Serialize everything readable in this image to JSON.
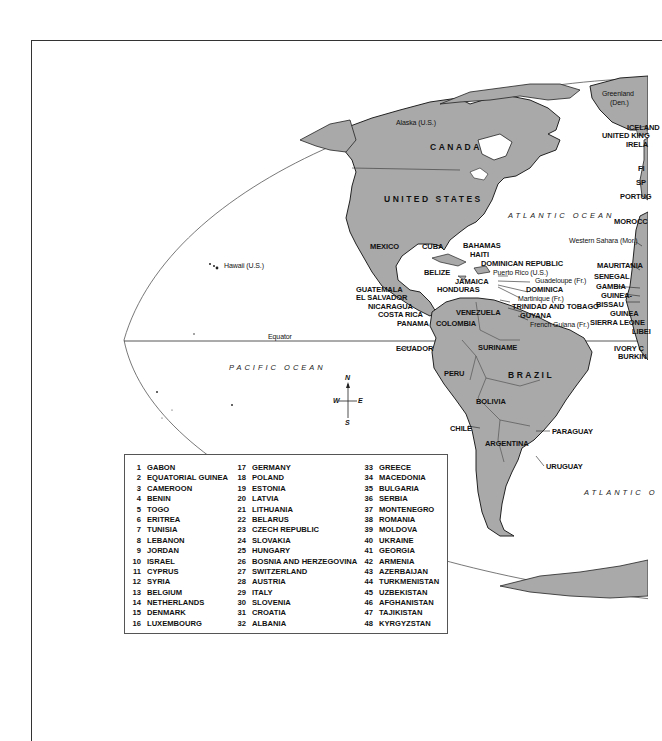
{
  "map": {
    "oceans": {
      "atlantic_north": "ATLANTIC OCEAN",
      "atlantic_south": "ATLANTIC O",
      "pacific": "PACIFIC OCEAN"
    },
    "lines": {
      "equator": "Equator"
    },
    "compass": {
      "n": "N",
      "s": "S",
      "e": "E",
      "w": "W"
    },
    "regions": {
      "greenland": "Greenland",
      "greenland_owner": "(Den.)",
      "alaska": "Alaska (U.S.)",
      "hawaii": "Hawaii (U.S.)",
      "western_sahara": "Western Sahara (Mor.)",
      "puerto_rico": "Puerto Rico (U.S.)",
      "guadeloupe": "Guadeloupe (Fr.)",
      "martinique": "Martinique (Fr.)",
      "french_guiana": "French Guiana (Fr.)"
    },
    "countries": {
      "canada": "CANADA",
      "united_states": "UNITED STATES",
      "brazil": "BRAZIL",
      "iceland": "ICELAND",
      "united_kingdom": "UNITED KING",
      "ireland": "IRELA",
      "france": "FI",
      "spain": "SP",
      "portugal": "PORTUG",
      "morocco": "MOROCC",
      "mexico": "MEXICO",
      "cuba": "CUBA",
      "bahamas": "BAHAMAS",
      "haiti": "HAITI",
      "dominican_republic": "DOMINICAN REPUBLIC",
      "belize": "BELIZE",
      "jamaica": "JAMAICA",
      "dominica": "DOMINICA",
      "honduras": "HONDURAS",
      "guatemala": "GUATEMALA",
      "el_salvador": "EL SALVADOR",
      "nicaragua": "NICARAGUA",
      "costa_rica": "COSTA RICA",
      "panama": "PANAMA",
      "colombia": "COLOMBIA",
      "venezuela": "VENEZUELA",
      "trinidad": "TRINIDAD AND TOBAGO",
      "guyana": "GUYANA",
      "suriname": "SURINAME",
      "ecuador": "ECUADOR",
      "peru": "PERU",
      "bolivia": "BOLIVIA",
      "chile": "CHILE",
      "argentina": "ARGENTINA",
      "paraguay": "PARAGUAY",
      "uruguay": "URUGUAY",
      "mauritania": "MAURITANIA",
      "senegal": "SENEGAL",
      "gambia": "GAMBIA",
      "guinea_bissau_1": "GUINEA-",
      "guinea_bissau_2": "BISSAU",
      "guinea": "GUINEA",
      "sierra_leone": "SIERRA LEONE",
      "liberia": "LIBEI",
      "ivory_coast": "IVORY C",
      "burkina": "BURKIN"
    },
    "colors": {
      "land": "#a9a9a9",
      "land_edge": "#222222",
      "frame": "#333333"
    }
  },
  "legend": {
    "columns": [
      [
        {
          "n": "1",
          "name": "GABON"
        },
        {
          "n": "2",
          "name": "EQUATORIAL GUINEA"
        },
        {
          "n": "3",
          "name": "CAMEROON"
        },
        {
          "n": "4",
          "name": "BENIN"
        },
        {
          "n": "5",
          "name": "TOGO"
        },
        {
          "n": "6",
          "name": "ERITREA"
        },
        {
          "n": "7",
          "name": "TUNISIA"
        },
        {
          "n": "8",
          "name": "LEBANON"
        },
        {
          "n": "9",
          "name": "JORDAN"
        },
        {
          "n": "10",
          "name": "ISRAEL"
        },
        {
          "n": "11",
          "name": "CYPRUS"
        },
        {
          "n": "12",
          "name": "SYRIA"
        },
        {
          "n": "13",
          "name": "BELGIUM"
        },
        {
          "n": "14",
          "name": "NETHERLANDS"
        },
        {
          "n": "15",
          "name": "DENMARK"
        },
        {
          "n": "16",
          "name": "LUXEMBOURG"
        }
      ],
      [
        {
          "n": "17",
          "name": "GERMANY"
        },
        {
          "n": "18",
          "name": "POLAND"
        },
        {
          "n": "19",
          "name": "ESTONIA"
        },
        {
          "n": "20",
          "name": "LATVIA"
        },
        {
          "n": "21",
          "name": "LITHUANIA"
        },
        {
          "n": "22",
          "name": "BELARUS"
        },
        {
          "n": "23",
          "name": "CZECH REPUBLIC"
        },
        {
          "n": "24",
          "name": "SLOVAKIA"
        },
        {
          "n": "25",
          "name": "HUNGARY"
        },
        {
          "n": "26",
          "name": "BOSNIA AND HERZEGOVINA"
        },
        {
          "n": "27",
          "name": "SWITZERLAND"
        },
        {
          "n": "28",
          "name": "AUSTRIA"
        },
        {
          "n": "29",
          "name": "ITALY"
        },
        {
          "n": "30",
          "name": "SLOVENIA"
        },
        {
          "n": "31",
          "name": "CROATIA"
        },
        {
          "n": "32",
          "name": "ALBANIA"
        }
      ],
      [
        {
          "n": "33",
          "name": "GREECE"
        },
        {
          "n": "34",
          "name": "MACEDONIA"
        },
        {
          "n": "35",
          "name": "BULGARIA"
        },
        {
          "n": "36",
          "name": "SERBIA"
        },
        {
          "n": "37",
          "name": "MONTENEGRO"
        },
        {
          "n": "38",
          "name": "ROMANIA"
        },
        {
          "n": "39",
          "name": "MOLDOVA"
        },
        {
          "n": "40",
          "name": "UKRAINE"
        },
        {
          "n": "41",
          "name": "GEORGIA"
        },
        {
          "n": "42",
          "name": "ARMENIA"
        },
        {
          "n": "43",
          "name": "AZERBAIJAN"
        },
        {
          "n": "44",
          "name": "TURKMENISTAN"
        },
        {
          "n": "45",
          "name": "UZBEKISTAN"
        },
        {
          "n": "46",
          "name": "AFGHANISTAN"
        },
        {
          "n": "47",
          "name": "TAJIKISTAN"
        },
        {
          "n": "48",
          "name": "KYRGYZSTAN"
        }
      ]
    ]
  }
}
